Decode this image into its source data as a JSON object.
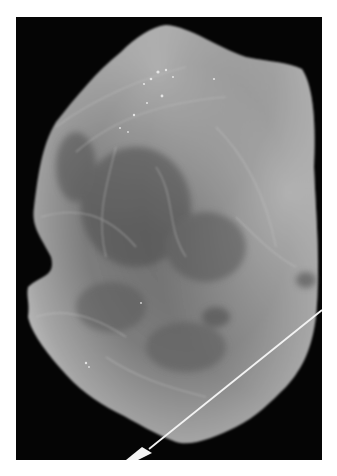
{
  "image": {
    "kind": "specimen radiograph",
    "description": "Grayscale X-ray of an irregular tissue specimen on black background with a localization wire entering from lower right",
    "colors": {
      "background": "#ffffff",
      "frame": "#050505",
      "tissue_dark": "#4a4a4a",
      "tissue_mid": "#7a7a7a",
      "tissue_light": "#b8b8b8",
      "wire": "#f2f2f2"
    }
  }
}
